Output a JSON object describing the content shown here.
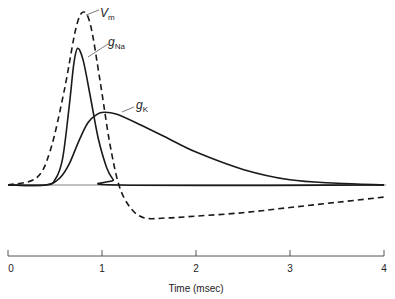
{
  "chart_data": {
    "type": "line",
    "title": "",
    "xlabel": "Time (msec)",
    "ylabel": "",
    "xlim": [
      0,
      4
    ],
    "ylim": [
      -0.3,
      1.05
    ],
    "x_ticks": [
      "0",
      "1",
      "2",
      "3",
      "4"
    ],
    "grid": false,
    "legend": "inline labels",
    "y_units": "normalized (baseline = 0, Vm peak = 1)",
    "series": [
      {
        "name": "Vm",
        "label_main": "V",
        "label_sub": "m",
        "style": "dashed",
        "points": [
          [
            0,
            0
          ],
          [
            0.3,
            0.04
          ],
          [
            0.45,
            0.2
          ],
          [
            0.6,
            0.55
          ],
          [
            0.72,
            0.9
          ],
          [
            0.8,
            1.0
          ],
          [
            0.88,
            0.92
          ],
          [
            0.98,
            0.6
          ],
          [
            1.08,
            0.25
          ],
          [
            1.18,
            0.0
          ],
          [
            1.3,
            -0.13
          ],
          [
            1.45,
            -0.19
          ],
          [
            1.7,
            -0.19
          ],
          [
            2.0,
            -0.18
          ],
          [
            2.5,
            -0.16
          ],
          [
            3.0,
            -0.13
          ],
          [
            3.5,
            -0.1
          ],
          [
            4.0,
            -0.07
          ]
        ]
      },
      {
        "name": "gNa",
        "label_main": "g",
        "label_sub": "Na",
        "style": "solid",
        "points": [
          [
            0,
            0
          ],
          [
            0.4,
            0.0
          ],
          [
            0.5,
            0.03
          ],
          [
            0.58,
            0.15
          ],
          [
            0.65,
            0.45
          ],
          [
            0.7,
            0.7
          ],
          [
            0.74,
            0.79
          ],
          [
            0.8,
            0.72
          ],
          [
            0.88,
            0.5
          ],
          [
            0.96,
            0.27
          ],
          [
            1.05,
            0.1
          ],
          [
            1.12,
            0.03
          ],
          [
            1.18,
            0.0
          ],
          [
            4.0,
            0.0
          ]
        ]
      },
      {
        "name": "gK",
        "label_main": "g",
        "label_sub": "K",
        "style": "solid",
        "points": [
          [
            0,
            0
          ],
          [
            0.4,
            0.0
          ],
          [
            0.55,
            0.04
          ],
          [
            0.65,
            0.12
          ],
          [
            0.75,
            0.25
          ],
          [
            0.85,
            0.36
          ],
          [
            0.95,
            0.41
          ],
          [
            1.02,
            0.42
          ],
          [
            1.15,
            0.41
          ],
          [
            1.4,
            0.35
          ],
          [
            1.7,
            0.27
          ],
          [
            2.0,
            0.19
          ],
          [
            2.5,
            0.09
          ],
          [
            3.0,
            0.03
          ],
          [
            3.5,
            0.01
          ],
          [
            4.0,
            0.0
          ]
        ]
      }
    ],
    "baseline": 0
  },
  "axis": {
    "xlabel": "Time (msec)",
    "ticks": [
      "0",
      "1",
      "2",
      "3",
      "4"
    ]
  },
  "labels": {
    "vm": {
      "main": "V",
      "sub": "m"
    },
    "gna": {
      "main": "g",
      "sub": "Na"
    },
    "gk": {
      "main": "g",
      "sub": "K"
    }
  }
}
